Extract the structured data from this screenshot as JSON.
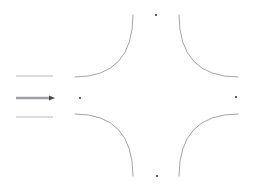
{
  "canvas": {
    "width": 254,
    "height": 190,
    "background": "#ffffff",
    "title": "pincushion-arc-diagram"
  },
  "palette": {
    "arc_stroke": "#8c8c92",
    "rule_stroke": "#b9b9bd",
    "rule_emphasis_stroke": "#a0a0a4",
    "dot_fill": "#3a3a3e",
    "arrow_fill": "#4a4a4e",
    "background": "#ffffff"
  },
  "legend_rules": [
    {
      "name": "top-rule",
      "x1": 16,
      "y1": 76,
      "x2": 53,
      "y2": 76,
      "width": 1.1,
      "color": "#b9b9bd",
      "has_arrow": false,
      "label": ""
    },
    {
      "name": "middle-rule",
      "x1": 16,
      "y1": 98,
      "x2": 50,
      "y2": 98,
      "width": 2.4,
      "color": "#a0a0a4",
      "has_arrow": true,
      "label": ""
    },
    {
      "name": "bottom-rule",
      "x1": 16,
      "y1": 117,
      "x2": 53,
      "y2": 117,
      "width": 1.1,
      "color": "#b9b9bd",
      "has_arrow": false,
      "label": ""
    }
  ],
  "arrow": {
    "name": "right-arrowhead",
    "tip_x": 55,
    "tip_y": 98,
    "back_x": 49,
    "half_height": 2.6
  },
  "arcs": [
    {
      "name": "arc-top-left",
      "quadrant": "top-left",
      "start_x": 133,
      "start_y": 15,
      "end_x": 75,
      "end_y": 77,
      "control_x": 133,
      "control_y": 77,
      "sweep": "concave-toward-center"
    },
    {
      "name": "arc-top-right",
      "quadrant": "top-right",
      "start_x": 179,
      "start_y": 15,
      "end_x": 238,
      "end_y": 77,
      "control_x": 179,
      "control_y": 77,
      "sweep": "concave-toward-center"
    },
    {
      "name": "arc-bottom-left",
      "quadrant": "bottom-left",
      "start_x": 75,
      "start_y": 114,
      "end_x": 133,
      "end_y": 176,
      "control_x": 133,
      "control_y": 114,
      "sweep": "concave-toward-center"
    },
    {
      "name": "arc-bottom-right",
      "quadrant": "bottom-right",
      "start_x": 238,
      "start_y": 114,
      "end_x": 179,
      "end_y": 176,
      "control_x": 179,
      "control_y": 114,
      "sweep": "concave-toward-center"
    }
  ],
  "dots": [
    {
      "name": "dot-top",
      "cx": 156,
      "cy": 15,
      "r": 1.1,
      "label": ""
    },
    {
      "name": "dot-left",
      "cx": 80,
      "cy": 98,
      "r": 1.1,
      "label": ""
    },
    {
      "name": "dot-right",
      "cx": 236,
      "cy": 97,
      "r": 1.1,
      "label": ""
    },
    {
      "name": "dot-bottom",
      "cx": 157,
      "cy": 176,
      "r": 1.1,
      "label": ""
    }
  ],
  "chart_data": {
    "type": "line",
    "title": "",
    "xlabel": "",
    "ylabel": "",
    "grid": false,
    "legend_position": "left",
    "series": [
      {
        "name": "arc-top-left",
        "values": [
          [
            133,
            15
          ],
          [
            110,
            30
          ],
          [
            95,
            48
          ],
          [
            84,
            64
          ],
          [
            75,
            77
          ]
        ]
      },
      {
        "name": "arc-top-right",
        "values": [
          [
            179,
            15
          ],
          [
            201,
            30
          ],
          [
            217,
            48
          ],
          [
            228,
            64
          ],
          [
            238,
            77
          ]
        ]
      },
      {
        "name": "arc-bottom-left",
        "values": [
          [
            75,
            114
          ],
          [
            84,
            127
          ],
          [
            95,
            143
          ],
          [
            110,
            161
          ],
          [
            133,
            176
          ]
        ]
      },
      {
        "name": "arc-bottom-right",
        "values": [
          [
            238,
            114
          ],
          [
            228,
            127
          ],
          [
            217,
            143
          ],
          [
            201,
            161
          ],
          [
            179,
            176
          ]
        ]
      }
    ],
    "markers": [
      [
        156,
        15
      ],
      [
        80,
        98
      ],
      [
        236,
        97
      ],
      [
        157,
        176
      ]
    ],
    "xlim": [
      0,
      254
    ],
    "ylim": [
      0,
      190
    ]
  }
}
